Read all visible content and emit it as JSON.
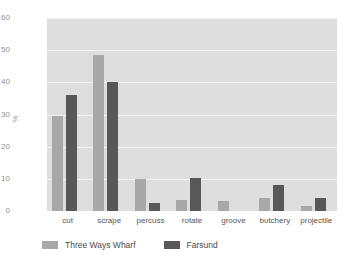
{
  "chart_data": {
    "type": "bar",
    "title": "",
    "xlabel": "",
    "ylabel": "%",
    "ylim": [
      0,
      60
    ],
    "yticks": [
      0,
      10,
      20,
      30,
      40,
      50,
      60
    ],
    "grid": true,
    "legend_position": "bottom-left",
    "categories": [
      "cut",
      "scrape",
      "percuss",
      "rotate",
      "groove",
      "butchery",
      "projectile"
    ],
    "series": [
      {
        "name": "Three Ways Wharf",
        "color": "#a8a8a8",
        "values": [
          29.5,
          48.5,
          10.0,
          3.5,
          3.0,
          4.0,
          1.5
        ]
      },
      {
        "name": "Farsund",
        "color": "#585858",
        "values": [
          36.0,
          40.0,
          2.5,
          10.2,
          0.0,
          8.0,
          4.2
        ]
      }
    ]
  },
  "colors": {
    "plot_background": "#dedede",
    "gridline": "#f2f2f2",
    "page_background": "#ffffff",
    "tick_text": "#8f8f8f",
    "category_text": "#555555",
    "legend_text": "#4a4a4a"
  }
}
